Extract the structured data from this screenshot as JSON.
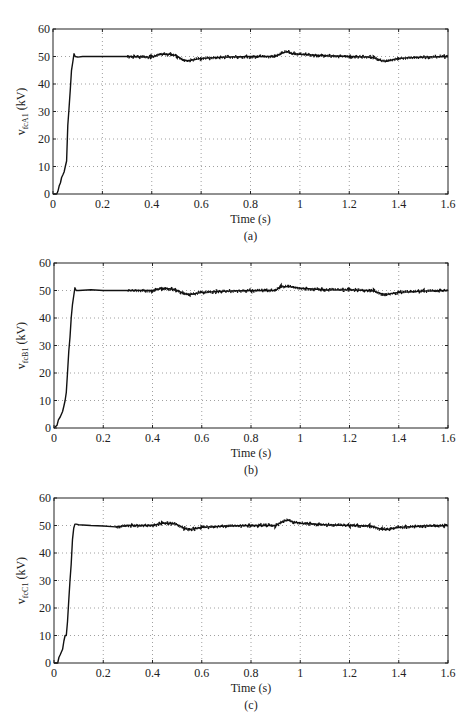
{
  "chart_data": [
    {
      "type": "line",
      "panel_label": "(a)",
      "xlabel": "Time (s)",
      "ylabel": {
        "main": "v",
        "sub": "fcA1",
        "unit": " (kV)"
      },
      "xlim": [
        0,
        1.6
      ],
      "ylim": [
        0,
        60
      ],
      "xticks": [
        0,
        0.2,
        0.4,
        0.6,
        0.8,
        1,
        1.2,
        1.4,
        1.6
      ],
      "xtick_labels": [
        "0",
        "0.2",
        "0.4",
        "0.6",
        "0.8",
        "1",
        "1.2",
        "1.4",
        "1.6"
      ],
      "yticks": [
        0,
        10,
        20,
        30,
        40,
        50,
        60
      ],
      "ytick_labels": [
        "0",
        "10",
        "20",
        "30",
        "40",
        "50",
        "60"
      ],
      "grid": true,
      "series": [
        {
          "name": "vfcA1",
          "x": [
            0,
            0.015,
            0.02,
            0.025,
            0.03,
            0.035,
            0.04,
            0.045,
            0.05,
            0.055,
            0.06,
            0.065,
            0.07,
            0.075,
            0.08,
            0.085,
            0.09,
            0.1,
            0.12,
            0.15,
            0.2,
            0.3,
            0.4,
            0.43,
            0.48,
            0.5,
            0.53,
            0.55,
            0.6,
            0.7,
            0.8,
            0.9,
            0.93,
            0.95,
            0.97,
            1.0,
            1.1,
            1.2,
            1.28,
            1.3,
            1.33,
            1.35,
            1.4,
            1.5,
            1.6
          ],
          "y": [
            0,
            0,
            1,
            3,
            4,
            6,
            7,
            8,
            10,
            12,
            25,
            31,
            38,
            45,
            48,
            51,
            50,
            49.8,
            50,
            50,
            50,
            50,
            49.8,
            50.8,
            50.8,
            50.3,
            48.5,
            48.5,
            49.3,
            49.8,
            50,
            50,
            51.3,
            51.8,
            51,
            50.8,
            50.3,
            50,
            49.8,
            49.5,
            48.5,
            48.3,
            49.3,
            49.8,
            50
          ]
        }
      ]
    },
    {
      "type": "line",
      "panel_label": "(b)",
      "xlabel": "Time (s)",
      "ylabel": {
        "main": "v",
        "sub": "fcB1",
        "unit": " (kV)"
      },
      "xlim": [
        0,
        1.6
      ],
      "ylim": [
        0,
        60
      ],
      "xticks": [
        0,
        0.2,
        0.4,
        0.6,
        0.8,
        1,
        1.2,
        1.4,
        1.6
      ],
      "xtick_labels": [
        "0",
        "0.2",
        "0.4",
        "0.6",
        "0.8",
        "1",
        "1.2",
        "1.4",
        "1.6"
      ],
      "yticks": [
        0,
        10,
        20,
        30,
        40,
        50,
        60
      ],
      "ytick_labels": [
        "0",
        "10",
        "20",
        "30",
        "40",
        "50",
        "60"
      ],
      "grid": true,
      "series": [
        {
          "name": "vfcB1",
          "x": [
            0,
            0.012,
            0.018,
            0.025,
            0.03,
            0.035,
            0.04,
            0.045,
            0.05,
            0.055,
            0.06,
            0.065,
            0.07,
            0.075,
            0.08,
            0.085,
            0.09,
            0.1,
            0.15,
            0.2,
            0.3,
            0.4,
            0.44,
            0.48,
            0.5,
            0.53,
            0.55,
            0.6,
            0.7,
            0.8,
            0.9,
            0.92,
            0.95,
            1.0,
            1.1,
            1.2,
            1.28,
            1.3,
            1.33,
            1.35,
            1.4,
            1.5,
            1.6
          ],
          "y": [
            0,
            1,
            3,
            4,
            5,
            6,
            8,
            10,
            13,
            20,
            28,
            33,
            40,
            45,
            48,
            51,
            50,
            50,
            50.3,
            50,
            50,
            50,
            50.8,
            50.5,
            50,
            48.8,
            48.5,
            49.3,
            49.8,
            50,
            50,
            51.3,
            51.5,
            50.8,
            50.3,
            50.2,
            50,
            49.8,
            48.8,
            48.6,
            49.3,
            49.8,
            50
          ]
        }
      ]
    },
    {
      "type": "line",
      "panel_label": "(c)",
      "xlabel": "Time (s)",
      "ylabel": {
        "main": "v",
        "sub": "fcC1",
        "unit": " (kV)"
      },
      "xlim": [
        0,
        1.6
      ],
      "ylim": [
        0,
        60
      ],
      "xticks": [
        0,
        0.2,
        0.4,
        0.6,
        0.8,
        1,
        1.2,
        1.4,
        1.6
      ],
      "xtick_labels": [
        "0",
        "0.2",
        "0.4",
        "0.6",
        "0.8",
        "1",
        "1.2",
        "1.4",
        "1.6"
      ],
      "yticks": [
        0,
        10,
        20,
        30,
        40,
        50,
        60
      ],
      "ytick_labels": [
        "0",
        "10",
        "20",
        "30",
        "40",
        "50",
        "60"
      ],
      "grid": true,
      "series": [
        {
          "name": "vfcC1",
          "x": [
            0,
            0.015,
            0.02,
            0.025,
            0.03,
            0.035,
            0.04,
            0.045,
            0.05,
            0.055,
            0.06,
            0.065,
            0.07,
            0.075,
            0.08,
            0.085,
            0.09,
            0.1,
            0.15,
            0.2,
            0.25,
            0.3,
            0.4,
            0.44,
            0.48,
            0.5,
            0.53,
            0.55,
            0.6,
            0.7,
            0.8,
            0.9,
            0.93,
            0.95,
            0.97,
            1.0,
            1.1,
            1.2,
            1.28,
            1.3,
            1.33,
            1.35,
            1.4,
            1.5,
            1.6
          ],
          "y": [
            0,
            0,
            2,
            3,
            4,
            5,
            8,
            10,
            10,
            15,
            23,
            30,
            36,
            45,
            49,
            50.5,
            50.5,
            50.3,
            50,
            49.8,
            49.5,
            50,
            50,
            50.8,
            50.8,
            50.3,
            49,
            48.5,
            49.3,
            49.8,
            50,
            50,
            51.5,
            52,
            51.3,
            50.8,
            50.3,
            50,
            49.8,
            49.5,
            48.6,
            48.5,
            49.3,
            49.8,
            50
          ]
        }
      ]
    }
  ]
}
